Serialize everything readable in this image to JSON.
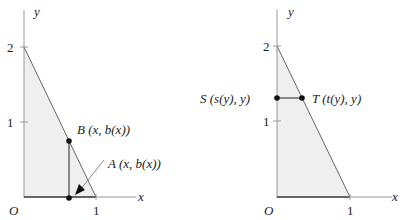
{
  "left_panel": {
    "axis_x_label": "x",
    "axis_y_label": "y",
    "origin_label": "O",
    "x_ticks": [
      "1"
    ],
    "y_ticks": [
      "1",
      "2"
    ],
    "point_b_label": "B (x, b(x))",
    "point_a_label": "A (x, b(x))"
  },
  "right_panel": {
    "axis_x_label": "x",
    "axis_y_label": "y",
    "origin_label": "O",
    "x_ticks": [
      "1"
    ],
    "y_ticks": [
      "1",
      "2"
    ],
    "point_s_label": "S (s(y), y)",
    "point_t_label": "T (t(y), y)"
  },
  "colors": {
    "region_fill": "#efefef",
    "axis": "#999999",
    "line": "#555555",
    "point": "#111111"
  }
}
